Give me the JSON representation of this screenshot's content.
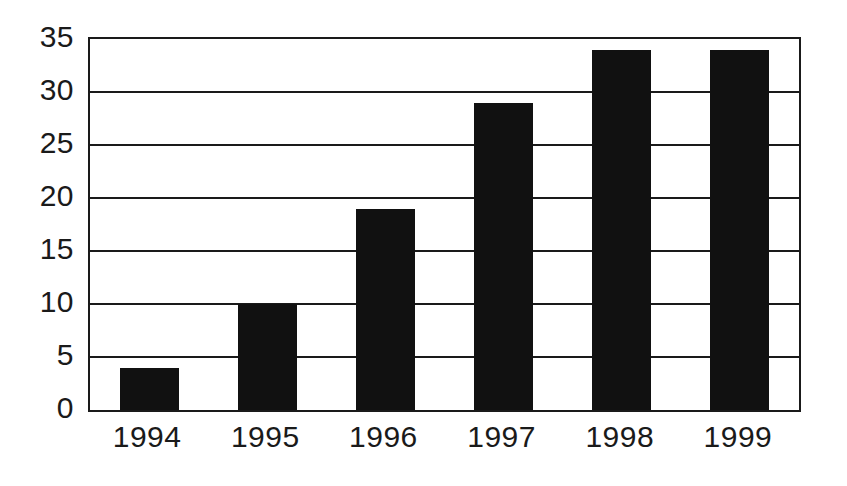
{
  "chart_data": {
    "type": "bar",
    "title": "",
    "subtitle": "",
    "xlabel": "",
    "ylabel": "",
    "categories": [
      "1994",
      "1995",
      "1996",
      "1997",
      "1998",
      "1999"
    ],
    "values": [
      4,
      10,
      19,
      29,
      34,
      34
    ],
    "series": [
      {
        "name": "",
        "values": [
          4,
          10,
          19,
          29,
          34,
          34
        ]
      }
    ],
    "ylim": [
      0,
      35
    ],
    "xlim": [
      0,
      6
    ],
    "yticks": [
      0,
      5,
      10,
      15,
      20,
      25,
      30,
      35
    ],
    "ytick_labels": [
      "0",
      "5",
      "10",
      "15",
      "20",
      "25",
      "30",
      "35"
    ],
    "xtick_labels": [
      "1994",
      "1995",
      "1996",
      "1997",
      "1998",
      "1999"
    ],
    "grid": true,
    "grid_axis": "y",
    "legend": false,
    "legend_position": "none",
    "annotations": [],
    "colors": {
      "bar": "#111111",
      "axis": "#1a1a1a",
      "gridline": "#1a1a1a",
      "background": "#ffffff",
      "tick_label": "#1a1a1a"
    }
  }
}
